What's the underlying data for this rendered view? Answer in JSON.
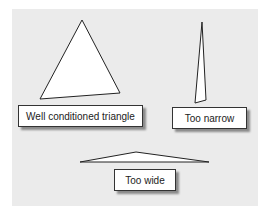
{
  "diagram": {
    "background_color": "#ebebeb",
    "triangles": [
      {
        "name": "well-conditioned",
        "points": "82,20 40,99 120,93"
      },
      {
        "name": "too-narrow",
        "points": "202,22 195,103 206,100"
      },
      {
        "name": "too-wide",
        "points": "80,162 136,152 209,162"
      }
    ],
    "labels": [
      {
        "text": "Well conditioned triangle"
      },
      {
        "text": "Too narrow"
      },
      {
        "text": "Too wide"
      }
    ]
  }
}
